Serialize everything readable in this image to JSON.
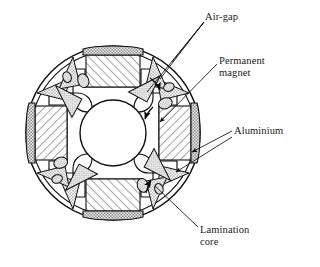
{
  "figure": {
    "type": "engineering-cross-section",
    "background_color": "#ffffff",
    "line_color": "#000000",
    "hatch_color": "#555555"
  },
  "labels": {
    "air_gap": "Air-gap",
    "permanent_magnet": "Permanent\nmagnet",
    "aluminium": "Aluminium",
    "lamination_core": "Lamination\ncore"
  },
  "geometry": {
    "center_x": 113,
    "center_y": 133,
    "outer_radius": 87,
    "inner_ring_radius": 82,
    "shaft_radius": 33,
    "pole_count": 4,
    "pole_angles_deg": [
      0,
      90,
      180,
      270
    ]
  },
  "components": {
    "magnet": {
      "name": "permanent-magnet",
      "fill_pattern": "diagonal-hatch",
      "count": 4
    },
    "aluminium_cap": {
      "name": "aluminium-cap",
      "fill_pattern": "stipple-checker",
      "count": 4
    },
    "air_gap_void": {
      "name": "air-gap-void",
      "fill_pattern": "stipple",
      "count": 16,
      "shapes": [
        "triangular-wedge",
        "oval-hole"
      ]
    },
    "flux_barrier": {
      "name": "flux-barrier-slot",
      "fill_pattern": "none",
      "count": 4
    },
    "shaft_bore": {
      "name": "shaft-bore",
      "fill_pattern": "none"
    }
  },
  "leaders": {
    "air_gap_arrow_count": 3,
    "permanent_magnet_arrow_count": 1,
    "aluminium_arrow_count": 2,
    "lamination_arrow_count": 1
  }
}
